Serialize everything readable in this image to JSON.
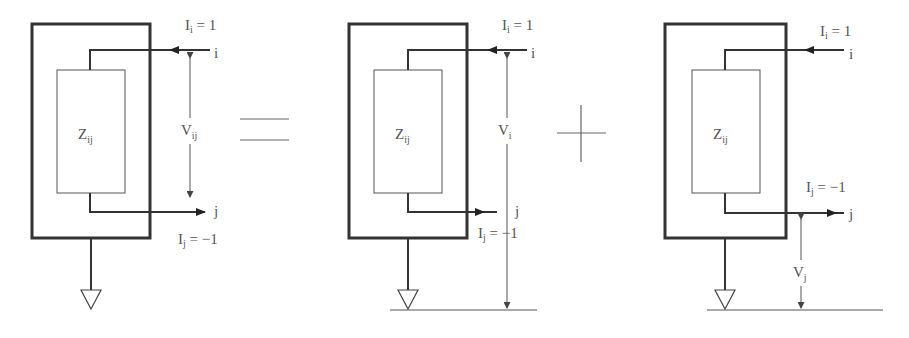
{
  "figure": {
    "operators": [
      "=",
      "+"
    ],
    "panels": [
      {
        "id": "combined",
        "impedance": {
          "main": "Z",
          "sub": "ij"
        },
        "current_i": {
          "main": "I",
          "sub": "i",
          "value": " = 1"
        },
        "current_j": {
          "main": "I",
          "sub": "j",
          "value": " = −1"
        },
        "node_i": "i",
        "node_j": "j",
        "voltage": {
          "main": "V",
          "sub": "ij"
        }
      },
      {
        "id": "node-i-contribution",
        "impedance": {
          "main": "Z",
          "sub": "ij"
        },
        "current_i": {
          "main": "I",
          "sub": "i",
          "value": " = 1"
        },
        "current_j": {
          "main": "I",
          "sub": "j",
          "value": " = −1"
        },
        "node_i": "i",
        "node_j": "j",
        "voltage": {
          "main": "V",
          "sub": "i"
        }
      },
      {
        "id": "node-j-contribution",
        "impedance": {
          "main": "Z",
          "sub": "ij"
        },
        "current_i": {
          "main": "I",
          "sub": "i",
          "value": " = 1"
        },
        "current_j": {
          "main": "I",
          "sub": "j",
          "value": " = −1"
        },
        "node_i": "i",
        "node_j": "j",
        "voltage": {
          "main": "V",
          "sub": "j"
        }
      }
    ]
  }
}
